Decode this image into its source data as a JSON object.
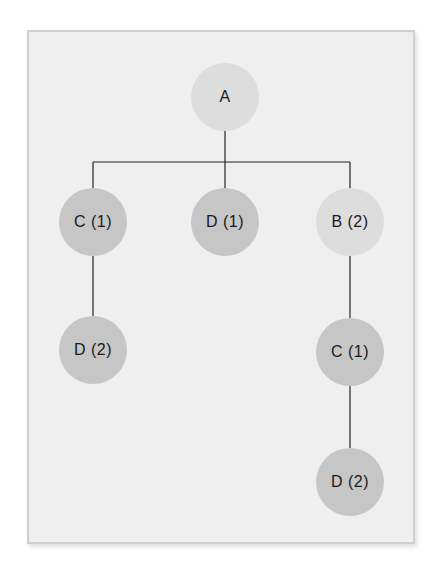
{
  "diagram": {
    "type": "tree",
    "nodes": [
      {
        "id": "a",
        "label": "A",
        "x": 225,
        "y": 97,
        "shade": "light"
      },
      {
        "id": "c1",
        "label": "C (1)",
        "x": 93,
        "y": 222,
        "shade": "dark"
      },
      {
        "id": "d1",
        "label": "D (1)",
        "x": 225,
        "y": 222,
        "shade": "dark"
      },
      {
        "id": "b2",
        "label": "B (2)",
        "x": 350,
        "y": 222,
        "shade": "light"
      },
      {
        "id": "d2a",
        "label": "D (2)",
        "x": 93,
        "y": 350,
        "shade": "dark"
      },
      {
        "id": "c1b",
        "label": "C (1)",
        "x": 350,
        "y": 352,
        "shade": "dark"
      },
      {
        "id": "d2b",
        "label": "D (2)",
        "x": 350,
        "y": 482,
        "shade": "dark"
      }
    ],
    "edges": [
      [
        "a",
        "c1"
      ],
      [
        "a",
        "d1"
      ],
      [
        "a",
        "b2"
      ],
      [
        "c1",
        "d2a"
      ],
      [
        "b2",
        "c1b"
      ],
      [
        "c1b",
        "d2b"
      ]
    ],
    "colors": {
      "panel_bg": "#efefef",
      "panel_border": "#cfcfcf",
      "node_light": "#dddddd",
      "node_dark": "#c6c6c6",
      "edge": "#222222",
      "text": "#1a1a1a"
    }
  }
}
